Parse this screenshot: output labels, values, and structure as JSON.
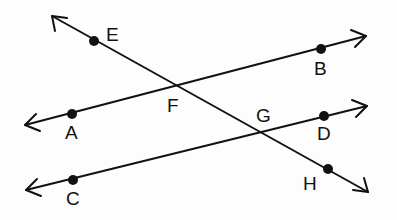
{
  "diagram": {
    "type": "geometry-lines",
    "lines": [
      {
        "name": "line-EH",
        "from": [
          52,
          16
        ],
        "to": [
          368,
          192
        ],
        "arrows": "both",
        "points": [
          "E",
          "F",
          "G",
          "H"
        ]
      },
      {
        "name": "line-AB",
        "from": [
          25,
          125
        ],
        "to": [
          366,
          36
        ],
        "arrows": "both",
        "points": [
          "A",
          "F",
          "B"
        ]
      },
      {
        "name": "line-CD",
        "from": [
          26,
          190
        ],
        "to": [
          367,
          106
        ],
        "arrows": "both",
        "points": [
          "C",
          "G",
          "D"
        ]
      }
    ],
    "points": {
      "A": {
        "label": "A",
        "x": 72,
        "y": 114,
        "dot": true
      },
      "B": {
        "label": "B",
        "x": 321,
        "y": 49,
        "dot": true
      },
      "C": {
        "label": "C",
        "x": 73,
        "y": 180,
        "dot": true
      },
      "D": {
        "label": "D",
        "x": 324,
        "y": 116,
        "dot": true
      },
      "E": {
        "label": "E",
        "x": 94,
        "y": 41,
        "dot": true
      },
      "F": {
        "label": "F",
        "x": 174,
        "y": 86,
        "dot": false
      },
      "G": {
        "label": "G",
        "x": 260,
        "y": 132,
        "dot": false
      },
      "H": {
        "label": "H",
        "x": 328,
        "y": 169,
        "dot": true
      }
    }
  }
}
